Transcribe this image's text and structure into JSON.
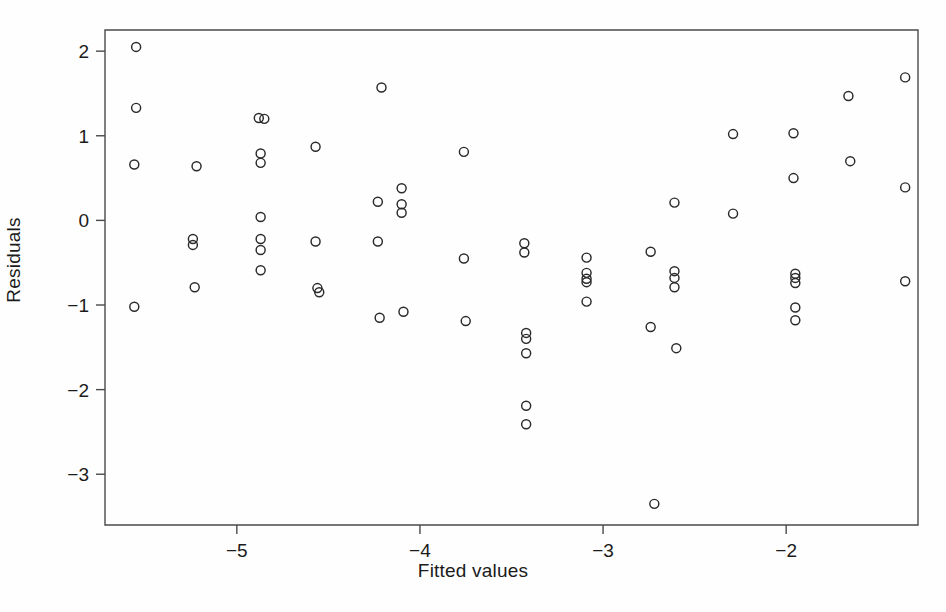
{
  "chart_data": {
    "type": "scatter",
    "title": "",
    "subtitle": "",
    "xlabel": "Fitted values",
    "ylabel": "Residuals",
    "xlim": [
      -5.72,
      -1.28
    ],
    "ylim": [
      -3.6,
      2.25
    ],
    "xticks": [
      -5,
      -4,
      -3,
      -2
    ],
    "xticklabels": [
      "−5",
      "−4",
      "−3",
      "−2"
    ],
    "yticks": [
      2,
      1,
      0,
      -1,
      -2,
      -3
    ],
    "yticklabels": [
      "2",
      "1",
      "0",
      "−1",
      "−2",
      "−3"
    ],
    "grid": false,
    "legend": null,
    "marker": "open-circle",
    "marker_size": 9,
    "marker_color": "#2a2a2a",
    "frame_color": "#4a4a4a",
    "background_color": "#fefefe",
    "n_points": 62,
    "points": [
      {
        "x": -5.55,
        "y": 2.05
      },
      {
        "x": -5.55,
        "y": 1.33
      },
      {
        "x": -5.56,
        "y": 0.66
      },
      {
        "x": -5.56,
        "y": -1.02
      },
      {
        "x": -5.22,
        "y": 0.64
      },
      {
        "x": -5.24,
        "y": -0.22
      },
      {
        "x": -5.24,
        "y": -0.29
      },
      {
        "x": -5.23,
        "y": -0.79
      },
      {
        "x": -4.88,
        "y": 1.21
      },
      {
        "x": -4.85,
        "y": 1.2
      },
      {
        "x": -4.87,
        "y": 0.79
      },
      {
        "x": -4.87,
        "y": 0.68
      },
      {
        "x": -4.87,
        "y": 0.04
      },
      {
        "x": -4.87,
        "y": -0.22
      },
      {
        "x": -4.87,
        "y": -0.35
      },
      {
        "x": -4.87,
        "y": -0.59
      },
      {
        "x": -4.57,
        "y": 0.87
      },
      {
        "x": -4.57,
        "y": -0.25
      },
      {
        "x": -4.56,
        "y": -0.8
      },
      {
        "x": -4.55,
        "y": -0.85
      },
      {
        "x": -4.21,
        "y": 1.57
      },
      {
        "x": -4.23,
        "y": 0.22
      },
      {
        "x": -4.23,
        "y": -0.25
      },
      {
        "x": -4.22,
        "y": -1.15
      },
      {
        "x": -4.1,
        "y": 0.38
      },
      {
        "x": -4.1,
        "y": 0.19
      },
      {
        "x": -4.1,
        "y": 0.09
      },
      {
        "x": -4.09,
        "y": -1.08
      },
      {
        "x": -3.76,
        "y": 0.81
      },
      {
        "x": -3.76,
        "y": -0.45
      },
      {
        "x": -3.75,
        "y": -1.19
      },
      {
        "x": -3.43,
        "y": -0.27
      },
      {
        "x": -3.43,
        "y": -0.38
      },
      {
        "x": -3.42,
        "y": -1.33
      },
      {
        "x": -3.42,
        "y": -1.4
      },
      {
        "x": -3.42,
        "y": -1.57
      },
      {
        "x": -3.42,
        "y": -2.19
      },
      {
        "x": -3.42,
        "y": -2.41
      },
      {
        "x": -3.09,
        "y": -0.44
      },
      {
        "x": -3.09,
        "y": -0.62
      },
      {
        "x": -3.09,
        "y": -0.69
      },
      {
        "x": -3.09,
        "y": -0.73
      },
      {
        "x": -3.09,
        "y": -0.96
      },
      {
        "x": -2.74,
        "y": -0.37
      },
      {
        "x": -2.74,
        "y": -1.26
      },
      {
        "x": -2.72,
        "y": -3.35
      },
      {
        "x": -2.61,
        "y": 0.21
      },
      {
        "x": -2.61,
        "y": -0.6
      },
      {
        "x": -2.61,
        "y": -0.68
      },
      {
        "x": -2.61,
        "y": -0.79
      },
      {
        "x": -2.6,
        "y": -1.51
      },
      {
        "x": -2.29,
        "y": 1.02
      },
      {
        "x": -2.29,
        "y": 0.08
      },
      {
        "x": -1.96,
        "y": 1.03
      },
      {
        "x": -1.96,
        "y": 0.5
      },
      {
        "x": -1.95,
        "y": -0.63
      },
      {
        "x": -1.95,
        "y": -0.68
      },
      {
        "x": -1.95,
        "y": -0.74
      },
      {
        "x": -1.95,
        "y": -1.03
      },
      {
        "x": -1.95,
        "y": -1.18
      },
      {
        "x": -1.66,
        "y": 1.47
      },
      {
        "x": -1.65,
        "y": 0.7
      },
      {
        "x": -1.35,
        "y": 1.69
      },
      {
        "x": -1.35,
        "y": 0.39
      },
      {
        "x": -1.35,
        "y": -0.72
      }
    ]
  },
  "axes": {
    "xlabel": "Fitted values",
    "ylabel": "Residuals"
  }
}
